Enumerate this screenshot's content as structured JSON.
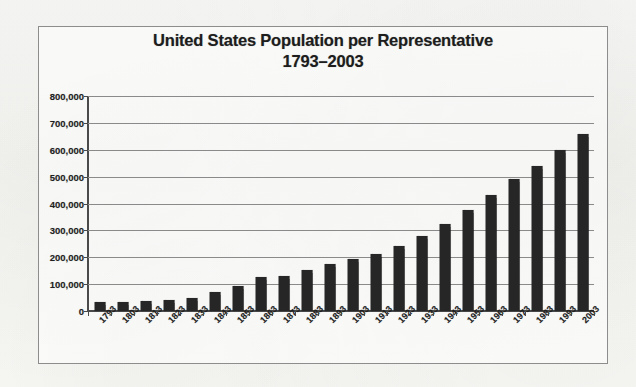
{
  "chart_data": {
    "type": "bar",
    "title": "United States Population per Representative",
    "subtitle": "1793–2003",
    "xlabel": "",
    "ylabel": "",
    "ylim": [
      0,
      800000
    ],
    "ytick_step": 100000,
    "grid": true,
    "legend": false,
    "bar_color": "#262626",
    "categories": [
      "1793",
      "1803",
      "1813",
      "1823",
      "1833",
      "1843",
      "1853",
      "1863",
      "1873",
      "1883",
      "1893",
      "1903",
      "1913",
      "1923",
      "1933",
      "1943",
      "1953",
      "1963",
      "1973",
      "1983",
      "1993",
      "2003"
    ],
    "values": [
      35000,
      35000,
      36000,
      40000,
      48000,
      71000,
      94000,
      127000,
      132000,
      152000,
      174000,
      194000,
      212000,
      243000,
      280000,
      322000,
      375000,
      430000,
      490000,
      540000,
      598000,
      660000
    ],
    "ytick_labels": [
      "800,000",
      "700,000",
      "600,000",
      "500,000",
      "400,000",
      "300,000",
      "200,000",
      "100,000",
      "0"
    ],
    "ytick_values": [
      800000,
      700000,
      600000,
      500000,
      400000,
      300000,
      200000,
      100000,
      0
    ]
  },
  "frame": {
    "border_color": "#8d8d8d"
  }
}
